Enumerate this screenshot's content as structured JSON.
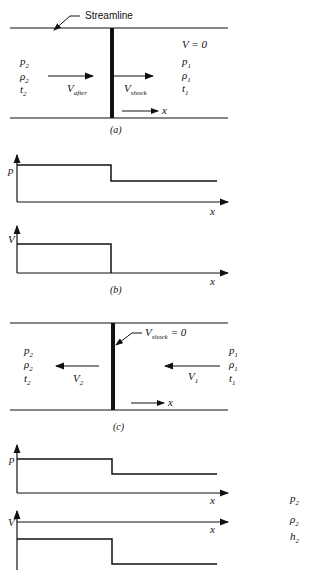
{
  "panel_a": {
    "streamline_label": "Streamline",
    "left_state": [
      "p",
      "ρ",
      "t"
    ],
    "left_sub": "2",
    "right_state": [
      "p",
      "ρ",
      "t"
    ],
    "right_sub": "1",
    "v_zero": "V = 0",
    "v_after": "V",
    "v_after_sub": "after",
    "v_shock": "V",
    "v_shock_sub": "shock",
    "x_label": "x",
    "caption": "(a)"
  },
  "panel_b": {
    "plot_p": {
      "ylabel": "p",
      "xlabel": "x"
    },
    "plot_v": {
      "ylabel": "V",
      "xlabel": "x"
    },
    "caption": "(b)"
  },
  "panel_c": {
    "shock_label": "V",
    "shock_sub": "shock",
    "shock_eq": "= 0",
    "left_state": [
      "p",
      "ρ",
      "t"
    ],
    "left_sub": "2",
    "right_state": [
      "p",
      "ρ",
      "t"
    ],
    "right_sub": "1",
    "v2": "V",
    "v2_sub": "2",
    "v1": "V",
    "v1_sub": "1",
    "x_label": "x",
    "caption": "(c)"
  },
  "panel_d": {
    "plot_p": {
      "ylabel": "p",
      "xlabel": "x"
    },
    "plot_v": {
      "ylabel": "V",
      "xlabel": "x"
    },
    "side_labels": [
      "p",
      "ρ",
      "h"
    ],
    "side_sub": "2"
  }
}
